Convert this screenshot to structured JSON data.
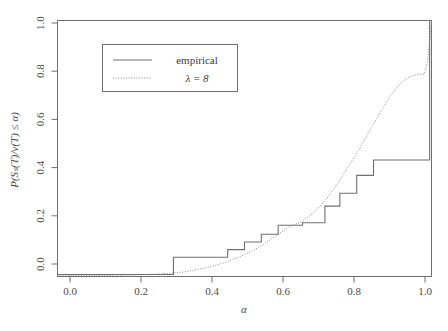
{
  "chart_data": {
    "type": "line",
    "title": "",
    "xlabel": "α",
    "ylabel": "P(Sₛ(T)/ν(T) ≤ α)",
    "xlim": [
      0.0,
      1.0
    ],
    "ylim": [
      0.0,
      1.0
    ],
    "grid": false,
    "legend_position": "top-center",
    "xticks": [
      "0.0",
      "0.2",
      "0.4",
      "0.6",
      "0.8",
      "1.0"
    ],
    "xtick_values": [
      0.0,
      0.2,
      0.4,
      0.6,
      0.8,
      1.0
    ],
    "yticks": [
      "0.0",
      "0.2",
      "0.4",
      "0.6",
      "0.8",
      "1.0"
    ],
    "ytick_values": [
      0.0,
      0.2,
      0.4,
      0.6,
      0.8,
      1.0
    ],
    "series": [
      {
        "name": "empirical",
        "style": "step",
        "linestyle": "solid",
        "color": "#707070",
        "x": [
          0.0,
          0.31,
          0.31,
          0.455,
          0.455,
          0.5,
          0.5,
          0.545,
          0.545,
          0.59,
          0.59,
          0.655,
          0.655,
          0.715,
          0.715,
          0.755,
          0.755,
          0.8,
          0.8,
          0.845,
          0.845,
          0.995,
          0.995,
          1.0
        ],
        "y": [
          0.008,
          0.008,
          0.075,
          0.075,
          0.105,
          0.105,
          0.135,
          0.135,
          0.165,
          0.165,
          0.2,
          0.2,
          0.21,
          0.21,
          0.275,
          0.275,
          0.325,
          0.325,
          0.395,
          0.395,
          0.455,
          0.455,
          1.0,
          1.0
        ]
      },
      {
        "name": "λ = 8",
        "style": "curve",
        "linestyle": "dotted",
        "color": "#8d8d8d",
        "x": [
          0.0,
          0.1,
          0.2,
          0.28,
          0.34,
          0.4,
          0.45,
          0.5,
          0.54,
          0.58,
          0.62,
          0.655,
          0.69,
          0.72,
          0.75,
          0.78,
          0.81,
          0.84,
          0.865,
          0.885,
          0.905,
          0.925,
          0.945,
          0.965,
          0.98,
          0.99,
          1.0
        ],
        "y": [
          0.003,
          0.004,
          0.006,
          0.01,
          0.018,
          0.035,
          0.055,
          0.085,
          0.115,
          0.155,
          0.195,
          0.215,
          0.255,
          0.305,
          0.365,
          0.435,
          0.505,
          0.585,
          0.645,
          0.695,
          0.735,
          0.765,
          0.782,
          0.79,
          0.79,
          0.84,
          1.0
        ]
      }
    ]
  },
  "legend": {
    "entries": [
      {
        "label": "empirical",
        "key": "solid-line-key"
      },
      {
        "label": "λ = 8",
        "key": "dotted-line-key"
      }
    ]
  },
  "axes": {
    "x_title": "α",
    "y_title": "P(Sₛ(T)/ν(T) ≤ α)"
  },
  "colors": {
    "empirical": "#707070",
    "model": "#8d8d8d",
    "frame": "#6f6f6f",
    "background": "#ffffff"
  }
}
